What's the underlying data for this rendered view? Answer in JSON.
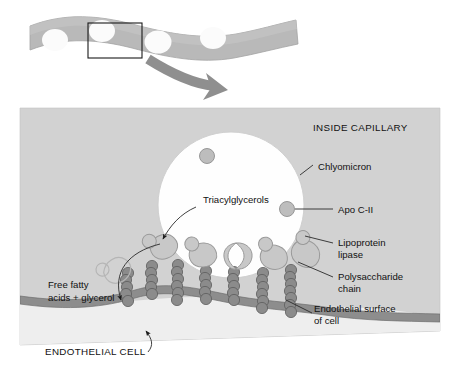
{
  "figure": {
    "width": 453,
    "height": 376
  },
  "colors": {
    "page_background": "#ffffff",
    "capillary_panel": "#d2d2d2",
    "capillary_panel_edge": "#c2c2c2",
    "chylomicron_fill": "#fefefe",
    "chylomicron_edge": "#cfcfcf",
    "membrane_band": "#8d8d8d",
    "membrane_band_edge": "#6f6f6f",
    "polysaccharide_bead": "#8b8b8b",
    "polysaccharide_bead_edge": "#5d5d5d",
    "lipase_fill": "#c8c8c8",
    "lipase_edge": "#9a9a9a",
    "apo_fill": "#bdbdbd",
    "apo_edge": "#8f8f8f",
    "tissue_ribbon": "#b9b9b9",
    "tissue_ribbon_edge": "#9d9d9d",
    "nucleus_fill": "#fbfbfb",
    "zoom_box_stroke": "#1a1a1a",
    "big_arrow": "#8f8f8f",
    "leader_line": "#2a2a2a",
    "text": "#111111"
  },
  "top_panel": {
    "name": "tissue-capillary-overview",
    "description": "Wavy gray capillary ribbon in cross section with four white endothelial cell nuclei",
    "nuclei_count": 4,
    "zoom_box": {
      "label": "magnified-region",
      "x": 88,
      "y": 23,
      "width": 54,
      "height": 35
    },
    "magnify_arrow": {
      "name": "magnify-arrow",
      "direction": "down-right"
    }
  },
  "main_panel": {
    "name": "capillary-lumen-panel",
    "region_label_inside": "INSIDE CAPILLARY",
    "region_label_below": "ENDOTHELIAL CELL"
  },
  "labels": [
    {
      "id": "inside-capillary",
      "text": "INSIDE CAPILLARY",
      "style": "caps",
      "x": 313,
      "y": 131
    },
    {
      "id": "chylomicron",
      "text": "Chlyomicron",
      "style": "mixed",
      "x": 318,
      "y": 170
    },
    {
      "id": "triacylglycerols",
      "text": "Triacylglycerols",
      "style": "mixed",
      "x": 203,
      "y": 203
    },
    {
      "id": "apo-c-ii",
      "text": "Apo C-II",
      "style": "mixed",
      "x": 338,
      "y": 213
    },
    {
      "id": "lipoprotein-lipase-line1",
      "text": "Lipoprotein",
      "style": "mixed",
      "x": 338,
      "y": 246
    },
    {
      "id": "lipoprotein-lipase-line2",
      "text": "lipase",
      "style": "mixed",
      "x": 338,
      "y": 258
    },
    {
      "id": "polysaccharide-line1",
      "text": "Polysaccharide",
      "style": "mixed",
      "x": 338,
      "y": 280
    },
    {
      "id": "polysaccharide-line2",
      "text": "chain",
      "style": "mixed",
      "x": 338,
      "y": 292
    },
    {
      "id": "endothelial-surface-line1",
      "text": "Endothelial surface",
      "style": "mixed",
      "x": 314,
      "y": 312
    },
    {
      "id": "endothelial-surface-line2",
      "text": "of cell",
      "style": "mixed",
      "x": 314,
      "y": 324
    },
    {
      "id": "free-fatty-acids-line1",
      "text": "Free fatty",
      "style": "mixed",
      "x": 48,
      "y": 288
    },
    {
      "id": "free-fatty-acids-line2",
      "text": "acids + glycerol",
      "style": "mixed",
      "x": 48,
      "y": 301
    },
    {
      "id": "endothelial-cell",
      "text": "ENDOTHELIAL CELL",
      "style": "caps",
      "x": 45,
      "y": 355
    }
  ],
  "chylomicron": {
    "name": "chylomicron-particle",
    "center_x": 231,
    "center_y": 205,
    "radius": 73,
    "interior_contents": "Triacylglycerols",
    "apo_c_ii_on_surface": 2
  },
  "apo_c_ii_particles": [
    {
      "id": "apo-inside-top",
      "x": 207,
      "y": 156,
      "r": 7.5
    },
    {
      "id": "apo-inside-right",
      "x": 287,
      "y": 209,
      "r": 7.5
    }
  ],
  "lipase_complexes": [
    {
      "id": "lipase-1",
      "x": 163,
      "y": 247,
      "rot": -28
    },
    {
      "id": "lipase-2",
      "x": 201,
      "y": 255,
      "rot": -8
    },
    {
      "id": "lipase-3",
      "x": 237,
      "y": 257,
      "rot": 0,
      "shape": "notched"
    },
    {
      "id": "lipase-4",
      "x": 272,
      "y": 257,
      "rot": 10
    },
    {
      "id": "lipase-5",
      "x": 303,
      "y": 252,
      "rot": 30
    },
    {
      "id": "lipase-ghost-left",
      "x": 118,
      "y": 271,
      "rot": -40,
      "ghost": true
    }
  ],
  "polysaccharide_chains": [
    {
      "id": "chain-1",
      "beads": 7
    },
    {
      "id": "chain-2",
      "beads": 7
    },
    {
      "id": "chain-3",
      "beads": 6
    },
    {
      "id": "chain-4",
      "beads": 6
    },
    {
      "id": "chain-5",
      "beads": 6
    },
    {
      "id": "chain-6",
      "beads": 7
    },
    {
      "id": "chain-7",
      "beads": 7
    }
  ],
  "arrows": [
    {
      "id": "triacylglycerols-arrow",
      "from": "Triacylglycerols label",
      "to": "chylomicron interior"
    },
    {
      "id": "free-fatty-acids-arrow",
      "from": "chylomicron surface",
      "to": "below membrane"
    },
    {
      "id": "endothelial-cell-arrow",
      "from": "ENDOTHELIAL CELL label",
      "to": "membrane band"
    }
  ]
}
